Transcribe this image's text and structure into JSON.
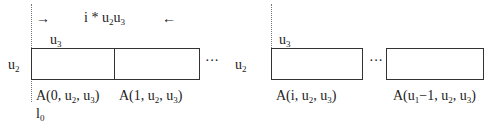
{
  "diagram": {
    "top_annotation": {
      "arrow_right": "→",
      "text_pre": "i * u",
      "sub1": "2",
      "mid": "u",
      "sub2": "3",
      "arrow_left": "←"
    },
    "left_group": {
      "width_label": {
        "base": "u",
        "sub": "3"
      },
      "height_label": {
        "base": "u",
        "sub": "2"
      },
      "boxes": [
        {
          "label_pre": "A(0, u",
          "sub_a": "2",
          "mid": ", u",
          "sub_b": "3",
          "post": ")"
        },
        {
          "label_pre": "A(1, u",
          "sub_a": "2",
          "mid": ", u",
          "sub_b": "3",
          "post": ")"
        }
      ],
      "ellipsis": "···",
      "origin_label": {
        "base": "l",
        "sub": "0"
      }
    },
    "right_group": {
      "width_label": {
        "base": "u",
        "sub": "3"
      },
      "height_label": {
        "base": "u",
        "sub": "2"
      },
      "boxes": [
        {
          "label_pre": "A(i, u",
          "sub_a": "2",
          "mid": ", u",
          "sub_b": "3",
          "post": ")"
        },
        {
          "label_pre": "A(u",
          "sub_u": "1",
          "label_mid": "−1, u",
          "sub_a": "2",
          "mid": ", u",
          "sub_b": "3",
          "post": ")"
        }
      ],
      "ellipsis": "···"
    }
  }
}
